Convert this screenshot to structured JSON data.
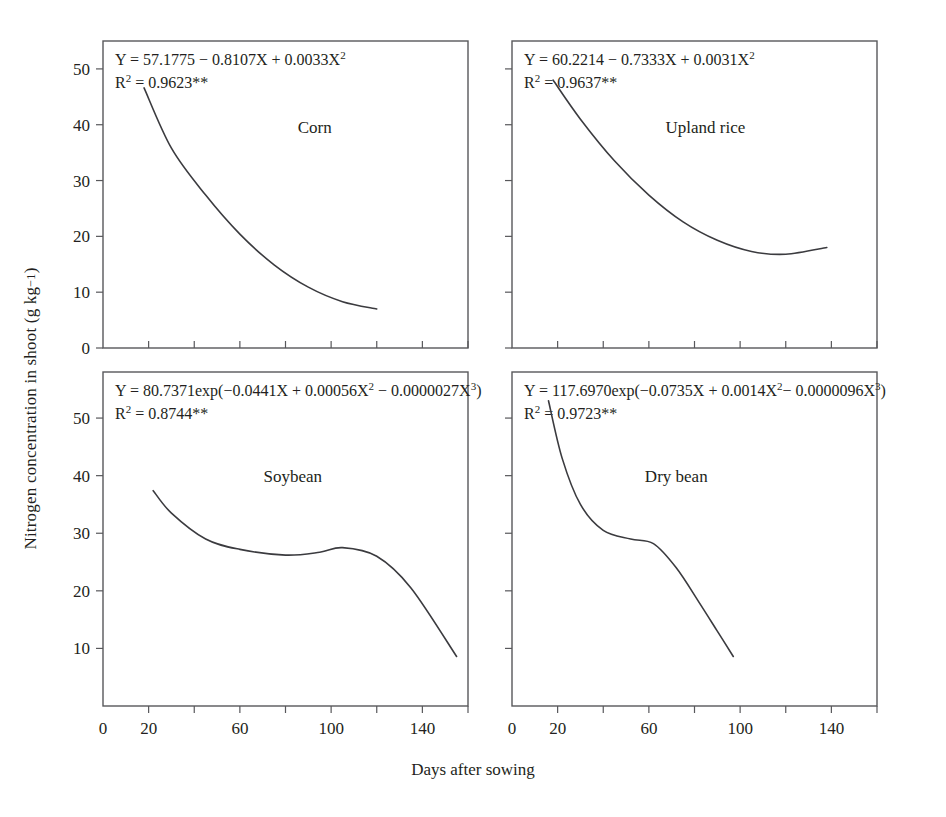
{
  "figure": {
    "xlabel": "Days after sowing",
    "ylabel_main": "Nitrogen concentration in shoot (g kg",
    "ylabel_sup": "−1",
    "ylabel_tail": ")",
    "ylabel_full": "Nitrogen concentration in shoot (g kg−1)",
    "line_color": "#3b3b3f",
    "axis_color": "#58585b",
    "text_color": "#231f20",
    "background": "#ffffff"
  },
  "chart_data": {
    "type": "line",
    "title": "",
    "xlabel": "Days after sowing",
    "ylabel": "Nitrogen concentration in shoot (g kg-1)",
    "layout": "2x2 panel grid, shared axes, no gridlines, no legend",
    "grid": false,
    "legend": "none",
    "panels": [
      {
        "id": "corn",
        "position": "top-left",
        "label": "Corn",
        "equation": "Y = 57.1775 − 0.8107X + 0.0033X",
        "equation_exp": "2",
        "r2_label": "R",
        "r2_sup": "2",
        "r2_value": " = 0.9623**",
        "model": "quadratic",
        "coefficients": {
          "a": 57.1775,
          "b": -0.8107,
          "c": 0.0033
        },
        "r2": 0.9623,
        "significance": "**",
        "x_range": [
          18,
          120
        ],
        "xlim": [
          0,
          160
        ],
        "ylim": [
          0,
          55
        ],
        "xticks": [
          0,
          20,
          40,
          60,
          80,
          100,
          120,
          140,
          160
        ],
        "xtick_labels": [
          "0",
          "20",
          "",
          "60",
          "",
          "100",
          "",
          "140",
          ""
        ],
        "yticks": [
          0,
          10,
          20,
          30,
          40,
          50
        ],
        "ytick_labels": [
          "0",
          "10",
          "20",
          "30",
          "40",
          "50"
        ],
        "points": [
          {
            "x": 18,
            "y": 46.6
          },
          {
            "x": 30,
            "y": 35.8
          },
          {
            "x": 45,
            "y": 27.4
          },
          {
            "x": 60,
            "y": 20.4
          },
          {
            "x": 75,
            "y": 14.9
          },
          {
            "x": 90,
            "y": 10.9
          },
          {
            "x": 105,
            "y": 8.3
          },
          {
            "x": 120,
            "y": 7.0
          }
        ]
      },
      {
        "id": "upland-rice",
        "position": "top-right",
        "label": "Upland rice",
        "equation": "Y = 60.2214 − 0.7333X + 0.0031X",
        "equation_exp": "2",
        "r2_label": "R",
        "r2_sup": "2",
        "r2_value": " = 0.9637**",
        "model": "quadratic",
        "coefficients": {
          "a": 60.2214,
          "b": -0.7333,
          "c": 0.0031
        },
        "r2": 0.9637,
        "significance": "**",
        "x_range": [
          18,
          138
        ],
        "xlim": [
          0,
          160
        ],
        "ylim": [
          0,
          55
        ],
        "xticks": [
          0,
          20,
          40,
          60,
          80,
          100,
          120,
          140,
          160
        ],
        "xtick_labels": [
          "0",
          "20",
          "",
          "60",
          "",
          "100",
          "",
          "140",
          ""
        ],
        "yticks": [
          0,
          10,
          20,
          30,
          40,
          50
        ],
        "ytick_labels": [
          "",
          "",
          "",
          "",
          "",
          ""
        ],
        "points": [
          {
            "x": 18,
            "y": 48.0
          },
          {
            "x": 30,
            "y": 41.0
          },
          {
            "x": 45,
            "y": 33.5
          },
          {
            "x": 60,
            "y": 27.4
          },
          {
            "x": 75,
            "y": 22.6
          },
          {
            "x": 90,
            "y": 19.3
          },
          {
            "x": 105,
            "y": 17.3
          },
          {
            "x": 120,
            "y": 16.8
          },
          {
            "x": 138,
            "y": 18.0
          }
        ]
      },
      {
        "id": "soybean",
        "position": "bottom-left",
        "label": "Soybean",
        "equation": "Y = 80.7371exp(−0.0441X + 0.00056X",
        "equation_exp": "2",
        "equation_mid": " − 0.0000027X",
        "equation_exp2": "3",
        "equation_tail": ")",
        "r2_label": "R",
        "r2_sup": "2",
        "r2_value": " = 0.8744**",
        "model": "exponential-cubic",
        "coefficients": {
          "a": 80.7371,
          "b": -0.0441,
          "c": 0.00056,
          "d": -2.7e-06
        },
        "r2": 0.8744,
        "significance": "**",
        "x_range": [
          22,
          155
        ],
        "xlim": [
          0,
          160
        ],
        "ylim": [
          0,
          58
        ],
        "xticks": [
          0,
          20,
          40,
          60,
          80,
          100,
          120,
          140,
          160
        ],
        "xtick_labels": [
          "0",
          "20",
          "",
          "60",
          "",
          "100",
          "",
          "140",
          ""
        ],
        "yticks": [
          10,
          20,
          30,
          40,
          50
        ],
        "ytick_labels": [
          "10",
          "20",
          "30",
          "40",
          "50"
        ],
        "points": [
          {
            "x": 22,
            "y": 37.4
          },
          {
            "x": 30,
            "y": 33.5
          },
          {
            "x": 45,
            "y": 29.0
          },
          {
            "x": 60,
            "y": 27.2
          },
          {
            "x": 80,
            "y": 26.2
          },
          {
            "x": 95,
            "y": 26.7
          },
          {
            "x": 105,
            "y": 27.5
          },
          {
            "x": 120,
            "y": 26.0
          },
          {
            "x": 135,
            "y": 20.5
          },
          {
            "x": 155,
            "y": 8.6
          }
        ]
      },
      {
        "id": "dry-bean",
        "position": "bottom-right",
        "label": "Dry bean",
        "equation": "Y = 117.6970exp(−0.0735X + 0.0014X",
        "equation_exp": "2",
        "equation_mid": "− 0.0000096X",
        "equation_exp2": "3",
        "equation_tail": ")",
        "r2_label": "R",
        "r2_sup": "2",
        "r2_value": " = 0.9723**",
        "model": "exponential-cubic",
        "coefficients": {
          "a": 117.697,
          "b": -0.0735,
          "c": 0.0014,
          "d": -9.6e-06
        },
        "r2": 0.9723,
        "significance": "**",
        "x_range": [
          16,
          97
        ],
        "xlim": [
          0,
          160
        ],
        "ylim": [
          0,
          58
        ],
        "xticks": [
          0,
          20,
          40,
          60,
          80,
          100,
          120,
          140,
          160
        ],
        "xtick_labels": [
          "0",
          "20",
          "",
          "60",
          "",
          "100",
          "",
          "140",
          ""
        ],
        "yticks": [
          10,
          20,
          30,
          40,
          50
        ],
        "ytick_labels": [
          "",
          "",
          "",
          "",
          ""
        ],
        "points": [
          {
            "x": 16,
            "y": 53.0
          },
          {
            "x": 22,
            "y": 43.0
          },
          {
            "x": 30,
            "y": 35.0
          },
          {
            "x": 40,
            "y": 30.5
          },
          {
            "x": 52,
            "y": 29.0
          },
          {
            "x": 62,
            "y": 28.2
          },
          {
            "x": 72,
            "y": 24.0
          },
          {
            "x": 82,
            "y": 18.0
          },
          {
            "x": 90,
            "y": 13.0
          },
          {
            "x": 97,
            "y": 8.6
          }
        ]
      }
    ]
  }
}
